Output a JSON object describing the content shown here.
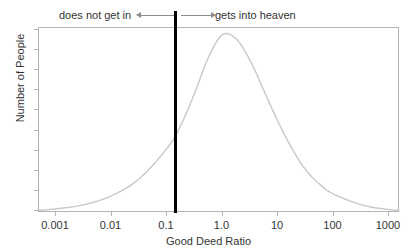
{
  "chart_data": {
    "type": "line",
    "title": "",
    "xlabel": "Good Deed Ratio",
    "ylabel": "Number of People",
    "xscale": "log",
    "xlim": [
      0.0003162,
      3162.0
    ],
    "ylim": [
      0,
      1.0
    ],
    "grid": false,
    "legend": null,
    "xtick_labels": [
      "0.001",
      "0.01",
      "0.1",
      "1.0",
      "10",
      "100",
      "1000"
    ],
    "xtick_values": [
      0.001,
      0.01,
      0.1,
      1.0,
      10,
      100,
      1000
    ],
    "ytick_labels": [],
    "series": [
      {
        "name": "Number of People",
        "color": "#c8c8c8",
        "x": [
          0.0003162,
          0.001,
          0.00316,
          0.01,
          0.0316,
          0.1,
          0.178,
          0.316,
          0.562,
          1.0,
          1.78,
          3.16,
          5.62,
          10,
          17.8,
          31.6,
          56.2,
          100,
          316,
          1000,
          3162
        ],
        "y": [
          0.0,
          0.012,
          0.035,
          0.085,
          0.18,
          0.35,
          0.48,
          0.66,
          0.86,
          0.985,
          0.96,
          0.84,
          0.67,
          0.5,
          0.35,
          0.23,
          0.15,
          0.095,
          0.035,
          0.008,
          0.0
        ]
      }
    ],
    "annotations": [
      {
        "name": "threshold-line",
        "type": "vline",
        "x_value": 0.15,
        "color": "#000000",
        "linewidth": 3
      },
      {
        "name": "left-annotation",
        "text": "does not get in",
        "arrow_direction": "left",
        "color": "#333333"
      },
      {
        "name": "right-annotation",
        "text": "gets into heaven",
        "arrow_direction": "right",
        "color": "#333333"
      }
    ]
  },
  "annotations": {
    "left_label": "does not get in",
    "right_label": "gets into heaven"
  },
  "axes": {
    "xlabel": "Good Deed Ratio",
    "ylabel": "Number of People",
    "xticks": [
      {
        "label": "0.001"
      },
      {
        "label": "0.01"
      },
      {
        "label": "0.1"
      },
      {
        "label": "1.0"
      },
      {
        "label": "10"
      },
      {
        "label": "100"
      },
      {
        "label": "1000"
      }
    ]
  },
  "colors": {
    "curve": "#c8c8c8",
    "frame": "#b4b4b4",
    "threshold": "#000000",
    "text": "#333333",
    "arrow": "#8c8c8c"
  }
}
